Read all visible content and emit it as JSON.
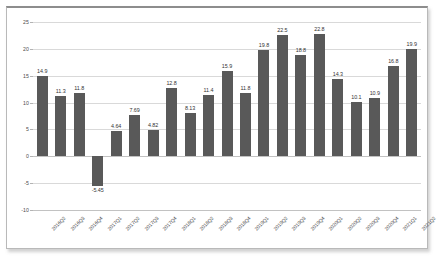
{
  "chart_data": {
    "type": "bar",
    "title": "",
    "subtitle": "",
    "xlabel": "",
    "ylabel": "",
    "ylim": [
      -10,
      25
    ],
    "yticks": [
      25,
      20,
      15,
      10,
      5,
      0,
      -5,
      -10
    ],
    "grid": true,
    "legend": false,
    "legend_position": "none",
    "bar_color": "#595959",
    "gridline_color": "#d9d9d9",
    "categories": [
      "2016Q2",
      "2016Q3",
      "2016Q4",
      "2017Q1",
      "2017Q2",
      "2017Q3",
      "2017Q4",
      "2018Q1",
      "2018Q2",
      "2018Q3",
      "2018Q4",
      "2019Q1",
      "2019Q2",
      "2019Q3",
      "2019Q4",
      "2020Q1",
      "2020Q2",
      "2020Q3",
      "2020Q4",
      "2021Q1",
      "2021Q2"
    ],
    "values": [
      14.9,
      11.3,
      11.8,
      -5.45,
      4.64,
      7.69,
      4.82,
      12.8,
      8.13,
      11.4,
      15.9,
      11.8,
      19.8,
      22.5,
      18.8,
      22.8,
      14.3,
      10.1,
      10.9,
      16.8,
      19.9
    ],
    "data_labels": [
      "14.9",
      "11.3",
      "11.8",
      "-5.45",
      "4.64",
      "7.69",
      "4.82",
      "12.8",
      "8.13",
      "11.4",
      "15.9",
      "11.8",
      "19.8",
      "22.5",
      "18.8",
      "22.8",
      "14.3",
      "10.1",
      "10.9",
      "16.8",
      "19.9"
    ],
    "ytick_labels": [
      "25",
      "20",
      "15",
      "10",
      "5",
      "0",
      "-5",
      "-10"
    ]
  }
}
